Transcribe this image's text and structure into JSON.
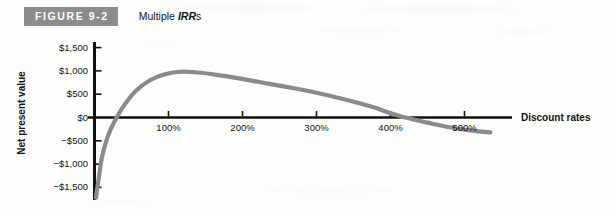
{
  "figure": {
    "badge_label": "FIGURE 9-2",
    "caption_prefix": "Multiple ",
    "caption_emphasis": "IRR",
    "caption_suffix": "s",
    "badge_bg": "#8c8c8c",
    "badge_text_color": "#ffffff"
  },
  "chart_data": {
    "type": "line",
    "title": "Multiple IRRs",
    "xlabel": "Discount rates",
    "ylabel": "Net present value",
    "xlim": [
      0,
      580
    ],
    "ylim": [
      -1800,
      1700
    ],
    "xticks": [
      100,
      200,
      300,
      400,
      500
    ],
    "xtick_labels": [
      "100%",
      "200%",
      "300%",
      "400%",
      "500%"
    ],
    "yticks": [
      -1500,
      -1000,
      -500,
      0,
      500,
      1000,
      1500
    ],
    "ytick_labels": [
      "−$1,500",
      "−$1,000",
      "−$500",
      "$0",
      "$500",
      "$1,000",
      "$1,500"
    ],
    "grid": false,
    "legend": false,
    "line_color": "#8a8a8a",
    "axis_color": "#111111",
    "series": [
      {
        "name": "Net present value",
        "x": [
          2,
          5,
          10,
          16,
          22,
          30,
          40,
          55,
          75,
          95,
          118,
          140,
          165,
          195,
          230,
          265,
          300,
          340,
          375,
          395,
          420,
          450,
          480,
          510,
          535
        ],
        "values": [
          -1720,
          -1380,
          -860,
          -500,
          -250,
          0,
          260,
          560,
          800,
          930,
          985,
          965,
          915,
          840,
          740,
          640,
          530,
          380,
          230,
          120,
          0,
          -110,
          -210,
          -280,
          -320
        ]
      }
    ],
    "annotations": [
      {
        "label": "zero crossing (first IRR)",
        "x": 30,
        "y": 0
      },
      {
        "label": "peak net present value",
        "x": 118,
        "y": 985
      },
      {
        "label": "zero crossing (second IRR)",
        "x": 420,
        "y": 0
      }
    ]
  }
}
